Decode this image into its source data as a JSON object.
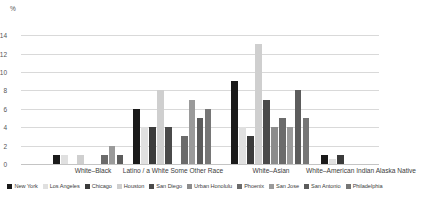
{
  "chart_data": {
    "type": "bar",
    "title": "",
    "subtitle": "",
    "xlabel": "",
    "ylabel": "%",
    "ylim": [
      0,
      15
    ],
    "yticks": [
      0,
      2,
      4,
      6,
      8,
      10,
      12,
      14
    ],
    "grid": true,
    "legend_position": "bottom",
    "categories": [
      "White–Black",
      "Latino / a White Some Other Race",
      "White–Asian",
      "White–American Indian Alaska Native"
    ],
    "series": [
      {
        "name": "New York",
        "color": "#1a1a1a",
        "values": [
          1,
          6,
          9,
          1
        ]
      },
      {
        "name": "Los Angeles",
        "color": "#e0e0e0",
        "values": [
          1,
          4,
          4,
          0.5
        ]
      },
      {
        "name": "Chicago",
        "color": "#3b3b3b",
        "values": [
          0,
          4,
          3,
          1
        ]
      },
      {
        "name": "Houston",
        "color": "#cfcfcf",
        "values": [
          1,
          8,
          13,
          0
        ]
      },
      {
        "name": "San Diego",
        "color": "#4a4a4a",
        "values": [
          0,
          4,
          7,
          0
        ]
      },
      {
        "name": "Urban Honolulu",
        "color": "#8c8c8c",
        "values": [
          0,
          0,
          4,
          0
        ]
      },
      {
        "name": "Phoenix",
        "color": "#6b6b6b",
        "values": [
          1,
          3,
          5,
          0
        ]
      },
      {
        "name": "San Jose",
        "color": "#9a9a9a",
        "values": [
          2,
          7,
          4,
          0
        ]
      },
      {
        "name": "San Antonio",
        "color": "#5c5c5c",
        "values": [
          1,
          5,
          8,
          0
        ]
      },
      {
        "name": "Philadelphia",
        "color": "#767676",
        "values": [
          0,
          6,
          5,
          0
        ]
      }
    ]
  },
  "axis": {
    "unit": "%"
  }
}
